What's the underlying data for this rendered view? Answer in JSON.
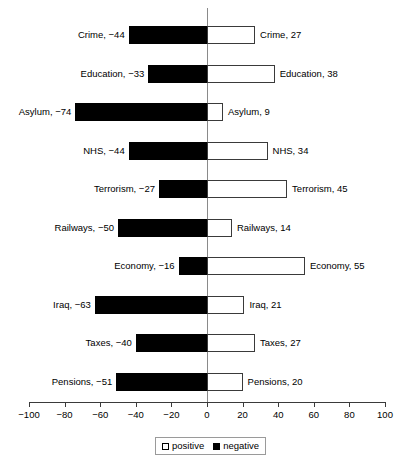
{
  "chart_data": {
    "type": "bar",
    "orientation": "horizontal",
    "style": "diverging-bar",
    "title": "",
    "subtitle": "",
    "xlabel": "",
    "ylabel": "",
    "xlim": [
      -100,
      100
    ],
    "xticks": [
      -100,
      -80,
      -60,
      -40,
      -20,
      0,
      20,
      40,
      60,
      80,
      100
    ],
    "xtick_labels": [
      "−100",
      "−80",
      "−60",
      "−40",
      "−20",
      "0",
      "20",
      "40",
      "60",
      "80",
      "100"
    ],
    "grid": false,
    "legend_position": "bottom",
    "categories": [
      "Crime",
      "Education",
      "Asylum",
      "NHS",
      "Terrorism",
      "Railways",
      "Economy",
      "Iraq",
      "Taxes",
      "Pensions"
    ],
    "series": [
      {
        "name": "negative",
        "color": "#000000",
        "values": [
          -44,
          -33,
          -74,
          -44,
          -27,
          -50,
          -16,
          -63,
          -40,
          -51
        ]
      },
      {
        "name": "positive",
        "color": "#ffffff",
        "values": [
          27,
          38,
          9,
          34,
          45,
          14,
          55,
          21,
          27,
          20
        ]
      }
    ],
    "rows": [
      {
        "category": "Crime",
        "negative": -44,
        "positive": 27,
        "left_label": "Crime, −44",
        "right_label": "Crime, 27"
      },
      {
        "category": "Education",
        "negative": -33,
        "positive": 38,
        "left_label": "Education, −33",
        "right_label": "Education, 38"
      },
      {
        "category": "Asylum",
        "negative": -74,
        "positive": 9,
        "left_label": "Asylum, −74",
        "right_label": "Asylum, 9"
      },
      {
        "category": "NHS",
        "negative": -44,
        "positive": 34,
        "left_label": "NHS, −44",
        "right_label": "NHS, 34"
      },
      {
        "category": "Terrorism",
        "negative": -27,
        "positive": 45,
        "left_label": "Terrorism, −27",
        "right_label": "Terrorism, 45"
      },
      {
        "category": "Railways",
        "negative": -50,
        "positive": 14,
        "left_label": "Railways, −50",
        "right_label": "Railways, 14"
      },
      {
        "category": "Economy",
        "negative": -16,
        "positive": 55,
        "left_label": "Economy, −16",
        "right_label": "Economy, 55"
      },
      {
        "category": "Iraq",
        "negative": -63,
        "positive": 21,
        "left_label": "Iraq, −63",
        "right_label": "Iraq, 21"
      },
      {
        "category": "Taxes",
        "negative": -40,
        "positive": 27,
        "left_label": "Taxes, −40",
        "right_label": "Taxes, 27"
      },
      {
        "category": "Pensions",
        "negative": -51,
        "positive": 20,
        "left_label": "Pensions, −51",
        "right_label": "Pensions, 20"
      }
    ],
    "legend": [
      {
        "label": "positive",
        "swatch": "white"
      },
      {
        "label": "negative",
        "swatch": "black"
      }
    ]
  }
}
